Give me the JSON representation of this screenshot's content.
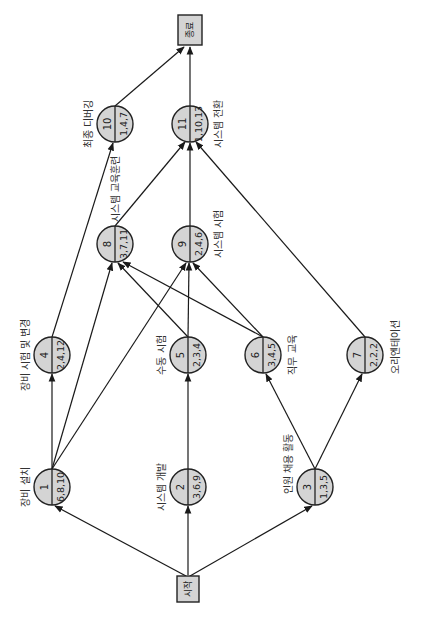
{
  "diagram": {
    "type": "activity-on-node network (rotated 90° counter-clockwise)",
    "start": {
      "label": "시작"
    },
    "end": {
      "label": "종료"
    },
    "nodes": [
      {
        "id": "1",
        "number": "1",
        "estimate": "6,8,10",
        "label": "장비 설치"
      },
      {
        "id": "2",
        "number": "2",
        "estimate": "3,6,9",
        "label": "시스템 개발"
      },
      {
        "id": "3",
        "number": "3",
        "estimate": "1,3,5",
        "label": "인원 채용 활동"
      },
      {
        "id": "4",
        "number": "4",
        "estimate": "2,4,12",
        "label": "장비 시험 및 변경"
      },
      {
        "id": "5",
        "number": "5",
        "estimate": "2,3,4",
        "label": "수동 시험"
      },
      {
        "id": "6",
        "number": "6",
        "estimate": "3,4,5",
        "label": "직무 교육"
      },
      {
        "id": "7",
        "number": "7",
        "estimate": "2,2,2",
        "label": "오리엔테이션"
      },
      {
        "id": "8",
        "number": "8",
        "estimate": "3,7,11",
        "label": "시스템 교육훈련"
      },
      {
        "id": "9",
        "number": "9",
        "estimate": "2,4,6",
        "label": "시스템 시험"
      },
      {
        "id": "10",
        "number": "10",
        "estimate": "1,4,7",
        "label": "최종 디버깅"
      },
      {
        "id": "11",
        "number": "11",
        "estimate": "1,10,13",
        "label": "시스템 전환"
      }
    ],
    "edges": [
      {
        "from": "start",
        "to": "1"
      },
      {
        "from": "start",
        "to": "2"
      },
      {
        "from": "start",
        "to": "3"
      },
      {
        "from": "1",
        "to": "4"
      },
      {
        "from": "1",
        "to": "8"
      },
      {
        "from": "1",
        "to": "9"
      },
      {
        "from": "2",
        "to": "5"
      },
      {
        "from": "3",
        "to": "6"
      },
      {
        "from": "3",
        "to": "7"
      },
      {
        "from": "4",
        "to": "10"
      },
      {
        "from": "5",
        "to": "8"
      },
      {
        "from": "5",
        "to": "9"
      },
      {
        "from": "6",
        "to": "8"
      },
      {
        "from": "6",
        "to": "9"
      },
      {
        "from": "7",
        "to": "11"
      },
      {
        "from": "8",
        "to": "11"
      },
      {
        "from": "9",
        "to": "11"
      },
      {
        "from": "10",
        "to": "end"
      },
      {
        "from": "11",
        "to": "end"
      }
    ],
    "colors": {
      "node_fill": "#d4d4d4",
      "stroke": "#222222",
      "background": "#ffffff"
    }
  }
}
